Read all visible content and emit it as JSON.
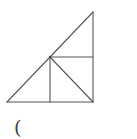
{
  "diagram": {
    "type": "geometry",
    "stroke_color": "#555555",
    "background": "#ffffff",
    "points": {
      "top": [
        93,
        12
      ],
      "bottom_left": [
        7,
        102
      ],
      "bottom_right": [
        93,
        102
      ],
      "mid": [
        50,
        57
      ],
      "right_mid": [
        93,
        57
      ],
      "bottom_mid": [
        50,
        102
      ]
    },
    "segments": [
      {
        "name": "hypotenuse",
        "from": "bottom_left",
        "to": "top"
      },
      {
        "name": "right-leg",
        "from": "top",
        "to": "bottom_right"
      },
      {
        "name": "base",
        "from": "bottom_left",
        "to": "bottom_right"
      },
      {
        "name": "horizontal-mid",
        "from": "mid",
        "to": "right_mid"
      },
      {
        "name": "vertical-mid",
        "from": "mid",
        "to": "bottom_mid"
      },
      {
        "name": "inner-diagonal",
        "from": "mid",
        "to": "bottom_right"
      }
    ]
  },
  "caption": {
    "text": "("
  }
}
